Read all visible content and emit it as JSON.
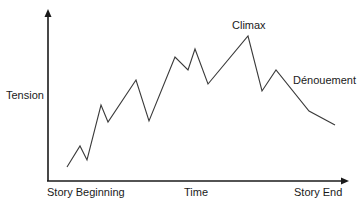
{
  "chart_data": {
    "type": "line",
    "title": "",
    "xlabel": "Time",
    "ylabel": "Tension",
    "x_tick_labels": [
      "Story Beginning",
      "Story End"
    ],
    "annotations": [
      {
        "text": "Climax",
        "at_point_index": 11
      },
      {
        "text": "Dénouement",
        "at_point_index": 13
      }
    ],
    "grid": false,
    "legend": null,
    "xlim": [
      0,
      100
    ],
    "ylim": [
      0,
      100
    ],
    "series": [
      {
        "name": "Tension",
        "x": [
          6,
          10,
          13,
          18,
          20,
          30,
          34,
          43,
          48,
          50,
          55,
          69,
          74,
          79,
          91,
          100
        ],
        "y": [
          10,
          21,
          14,
          44,
          35,
          57,
          36,
          69,
          62,
          73,
          55,
          80,
          51,
          62,
          41,
          33
        ]
      }
    ],
    "pixel_points": [
      [
        67,
        167
      ],
      [
        80,
        146
      ],
      [
        87,
        160
      ],
      [
        101,
        105
      ],
      [
        108,
        122
      ],
      [
        136,
        80
      ],
      [
        149,
        121
      ],
      [
        175,
        57
      ],
      [
        188,
        70
      ],
      [
        195,
        49
      ],
      [
        208,
        84
      ],
      [
        248,
        36
      ],
      [
        262,
        91
      ],
      [
        276,
        70
      ],
      [
        309,
        111
      ],
      [
        335,
        125
      ]
    ]
  },
  "labels": {
    "y_axis": "Tension",
    "x_axis": "Time",
    "x_start": "Story Beginning",
    "x_end": "Story End",
    "climax": "Climax",
    "denouement": "Dénouement"
  },
  "colors": {
    "line": "#3a3a3a",
    "axis": "#1a1a1a",
    "text": "#1a1a1a"
  }
}
